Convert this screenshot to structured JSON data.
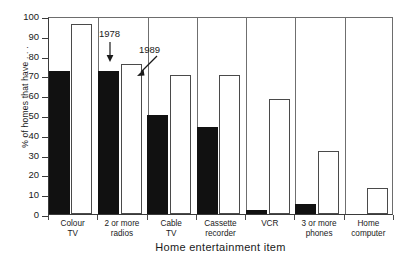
{
  "chart_data": {
    "type": "bar",
    "title": "",
    "xlabel": "Home entertainment item",
    "ylabel": "% of homes that have . . .",
    "ylim": [
      0,
      100
    ],
    "yticks": [
      0,
      10,
      20,
      30,
      40,
      50,
      60,
      70,
      80,
      90,
      100
    ],
    "grid": false,
    "legend_position": "none",
    "categories": [
      "Colour\nTV",
      "2 or more\nradios",
      "Cable\nTV",
      "Cassette\nrecorder",
      "VCR",
      "3 or more\nphones",
      "Home\ncomputer"
    ],
    "series": [
      {
        "name": "1978",
        "color": "#111111",
        "style": "filled",
        "values": [
          72,
          72,
          50,
          44,
          2,
          5,
          0
        ]
      },
      {
        "name": "1989",
        "color": "#ffffff",
        "style": "outlined",
        "values": [
          96,
          76,
          70,
          70,
          58,
          32,
          13
        ]
      }
    ],
    "annotations": [
      {
        "text": "1978",
        "points_to": "1978 bar of 2 or more radios",
        "arrow": "down"
      },
      {
        "text": "1989",
        "points_to": "1989 bar of 2 or more radios",
        "arrow": "down-left"
      }
    ]
  },
  "axis": {
    "y_label": "% of homes that have . . .",
    "x_title": "Home entertainment item"
  },
  "top_title": ""
}
